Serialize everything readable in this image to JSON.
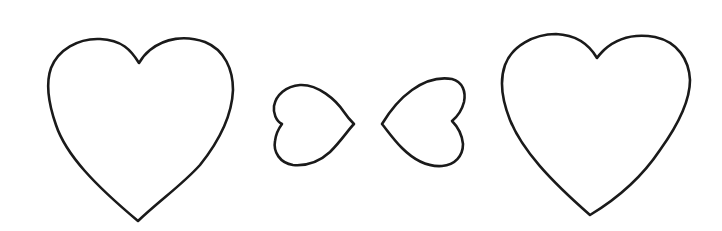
{
  "image": {
    "description": "Line drawing of four heart outlines: two large upright hearts at the ends and two small sideways hearts in the middle pointing toward each other",
    "background": "#ffffff",
    "stroke_color": "#1a1a1a"
  },
  "hearts": [
    {
      "label": "large-heart-left",
      "orientation": "upright",
      "size": "large"
    },
    {
      "label": "small-heart-pointing-right",
      "orientation": "pointing-right",
      "size": "small"
    },
    {
      "label": "small-heart-pointing-left",
      "orientation": "pointing-left",
      "size": "small"
    },
    {
      "label": "large-heart-right",
      "orientation": "upright",
      "size": "large"
    }
  ]
}
